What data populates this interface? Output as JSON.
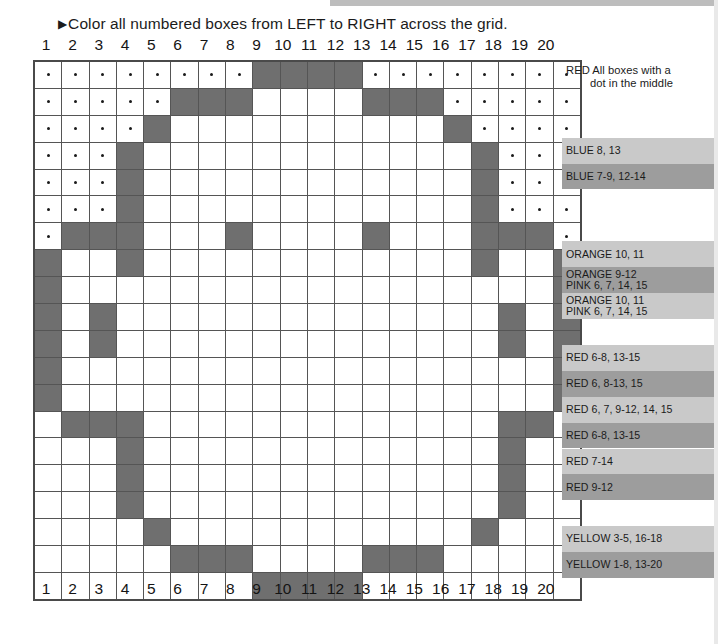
{
  "page": {
    "instruction": "Color all numbered boxes from LEFT to RIGHT across the grid.",
    "arrow_glyph": "▶"
  },
  "grid": {
    "columns": 20,
    "rows": 20,
    "column_labels": [
      "1",
      "2",
      "3",
      "4",
      "5",
      "6",
      "7",
      "8",
      "9",
      "10",
      "11",
      "12",
      "13",
      "14",
      "15",
      "16",
      "17",
      "18",
      "19",
      "20"
    ],
    "fill_color": "#6f6f6f",
    "empty_color": "#ffffff",
    "border_color": "#555555",
    "dot_color": "#1a1a1a",
    "filled_cells": [
      [
        9,
        10,
        11,
        12
      ],
      [
        6,
        7,
        8,
        13,
        14,
        15
      ],
      [
        5,
        16
      ],
      [
        4,
        17
      ],
      [
        4,
        17
      ],
      [
        4,
        17
      ],
      [
        2,
        3,
        4,
        8,
        13,
        17,
        18,
        19
      ],
      [
        1,
        4,
        17,
        20
      ],
      [
        1,
        20
      ],
      [
        1,
        3,
        18,
        20
      ],
      [
        1,
        3,
        18,
        20
      ],
      [
        1,
        20
      ],
      [
        1,
        20
      ],
      [
        2,
        3,
        4,
        18,
        19
      ],
      [
        4,
        18
      ],
      [
        4,
        18
      ],
      [
        4,
        18
      ],
      [
        5,
        17
      ],
      [
        6,
        7,
        8,
        13,
        14,
        15
      ],
      [
        9,
        10,
        11,
        12
      ]
    ],
    "dot_cells": [
      [
        1,
        2,
        3,
        4,
        5,
        6,
        7,
        8,
        13,
        14,
        15,
        16,
        17,
        18,
        19,
        20
      ],
      [
        1,
        2,
        3,
        4,
        5,
        16,
        17,
        18,
        19,
        20
      ],
      [
        1,
        2,
        3,
        4,
        17,
        18,
        19,
        20
      ],
      [
        1,
        2,
        3,
        18,
        19,
        20
      ],
      [
        1,
        2,
        3,
        18,
        19,
        20
      ],
      [
        1,
        2,
        3,
        18,
        19,
        20
      ],
      [
        1,
        20
      ],
      [],
      [],
      [],
      [],
      [],
      [],
      [],
      [],
      [],
      [],
      [],
      [],
      []
    ]
  },
  "legend": {
    "header": {
      "line1": "RED All boxes with a",
      "line2": "dot in the middle"
    },
    "rows": [
      {
        "row": 1,
        "band": "none",
        "text": ""
      },
      {
        "row": 2,
        "band": "none",
        "text": ""
      },
      {
        "row": 3,
        "band": "none",
        "text": ""
      },
      {
        "row": 4,
        "band": "light",
        "text": "BLUE 8, 13"
      },
      {
        "row": 5,
        "band": "dark",
        "text": "BLUE 7-9, 12-14"
      },
      {
        "row": 6,
        "band": "none",
        "text": ""
      },
      {
        "row": 7,
        "band": "none",
        "text": ""
      },
      {
        "row": 8,
        "band": "light",
        "text": "ORANGE 10, 11"
      },
      {
        "row": 9,
        "band": "dark",
        "text": "ORANGE 9-12\nPINK 6, 7, 14, 15"
      },
      {
        "row": 10,
        "band": "light",
        "text": "ORANGE 10, 11\nPINK 6, 7, 14, 15"
      },
      {
        "row": 11,
        "band": "none",
        "text": ""
      },
      {
        "row": 12,
        "band": "light",
        "text": "RED 6-8, 13-15"
      },
      {
        "row": 13,
        "band": "dark",
        "text": "RED 6, 8-13, 15"
      },
      {
        "row": 14,
        "band": "light",
        "text": "RED 6, 7, 9-12, 14, 15"
      },
      {
        "row": 15,
        "band": "dark",
        "text": "RED 6-8, 13-15"
      },
      {
        "row": 16,
        "band": "light",
        "text": "RED 7-14"
      },
      {
        "row": 17,
        "band": "dark",
        "text": "RED 9-12"
      },
      {
        "row": 18,
        "band": "none",
        "text": ""
      },
      {
        "row": 19,
        "band": "light",
        "text": "YELLOW 3-5, 16-18"
      },
      {
        "row": 20,
        "band": "dark",
        "text": "YELLOW 1-8, 13-20"
      }
    ],
    "band_light_color": "#c9c9c9",
    "band_dark_color": "#9d9d9d"
  }
}
